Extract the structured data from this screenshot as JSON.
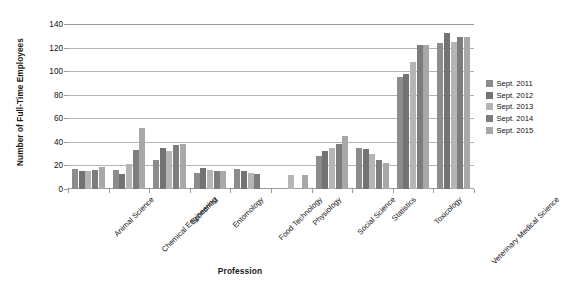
{
  "chart_data": {
    "type": "bar",
    "title": "",
    "xlabel": "Profession",
    "ylabel": "Number of Full-Time Employees",
    "ylim": [
      0,
      140
    ],
    "yticks": [
      "0",
      "20",
      "40",
      "60",
      "80",
      "100",
      "120",
      "140"
    ],
    "grid": true,
    "legend_position": "right",
    "categories": [
      "Animal Science",
      "Chemical Engineering",
      "Economist",
      "Entomology",
      "Food Technology",
      "Physiology",
      "Social Science",
      "Statistics",
      "Toxicology",
      "Veterinary Medical Science"
    ],
    "series": [
      {
        "name": "Sept. 2011",
        "color": "#8c8c8c",
        "values": [
          17,
          16,
          25,
          14,
          17,
          0,
          28,
          35,
          95,
          124
        ]
      },
      {
        "name": "Sept. 2012",
        "color": "#737373",
        "values": [
          15,
          13,
          35,
          18,
          15,
          0,
          32,
          34,
          98,
          132
        ]
      },
      {
        "name": "Sept. 2013",
        "color": "#b5b5b5",
        "values": [
          15,
          21,
          32,
          16,
          14,
          12,
          35,
          30,
          108,
          125
        ]
      },
      {
        "name": "Sept. 2014",
        "color": "#7d7d7d",
        "values": [
          16,
          33,
          37,
          15,
          13,
          0,
          38,
          25,
          122,
          129
        ]
      },
      {
        "name": "Sept. 2015",
        "color": "#a8a8a8",
        "values": [
          19,
          52,
          38,
          15,
          0,
          12,
          45,
          22,
          122,
          129
        ]
      }
    ]
  },
  "legend": {
    "items": [
      {
        "label": "Sept. 2011"
      },
      {
        "label": "Sept. 2012"
      },
      {
        "label": "Sept. 2013"
      },
      {
        "label": "Sept. 2014"
      },
      {
        "label": "Sept. 2015"
      }
    ]
  },
  "colors": {
    "gridline": "#b4b4b4",
    "axis": "#9a9a9a",
    "text": "#111111",
    "background": "#ffffff"
  }
}
